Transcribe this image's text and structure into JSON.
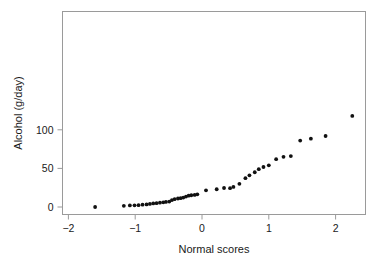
{
  "chart_data": {
    "type": "scatter",
    "title": "",
    "xlabel": "Normal scores",
    "ylabel": "Alcohol (g/day)",
    "xlim": [
      -2.32,
      2.43
    ],
    "ylim": [
      -8,
      128
    ],
    "xticks": [
      -2,
      -1,
      0,
      1,
      2
    ],
    "xtick_labels": [
      "−2",
      "−1",
      "0",
      "1",
      "2"
    ],
    "yticks": [
      0,
      50,
      100
    ],
    "ytick_labels": [
      "0",
      "50",
      "100"
    ],
    "grid": false,
    "legend": "none",
    "marker": "filled-circle",
    "marker_color": "#111111",
    "frame_color": "#9a9a9a",
    "points": [
      {
        "x": -1.6,
        "y": 0.0
      },
      {
        "x": -1.17,
        "y": 1.5
      },
      {
        "x": -1.08,
        "y": 2.0
      },
      {
        "x": -1.01,
        "y": 2.2
      },
      {
        "x": -0.95,
        "y": 2.3
      },
      {
        "x": -0.89,
        "y": 3.0
      },
      {
        "x": -0.83,
        "y": 3.4
      },
      {
        "x": -0.78,
        "y": 4.0
      },
      {
        "x": -0.73,
        "y": 4.6
      },
      {
        "x": -0.68,
        "y": 5.0
      },
      {
        "x": -0.63,
        "y": 5.6
      },
      {
        "x": -0.58,
        "y": 6.1
      },
      {
        "x": -0.54,
        "y": 6.6
      },
      {
        "x": -0.49,
        "y": 7.0
      },
      {
        "x": -0.45,
        "y": 9.0
      },
      {
        "x": -0.41,
        "y": 10.2
      },
      {
        "x": -0.36,
        "y": 11.0
      },
      {
        "x": -0.32,
        "y": 11.4
      },
      {
        "x": -0.28,
        "y": 12.2
      },
      {
        "x": -0.24,
        "y": 13.5
      },
      {
        "x": -0.2,
        "y": 14.7
      },
      {
        "x": -0.16,
        "y": 15.2
      },
      {
        "x": -0.11,
        "y": 15.6
      },
      {
        "x": -0.07,
        "y": 16.4
      },
      {
        "x": 0.06,
        "y": 21.6
      },
      {
        "x": 0.22,
        "y": 23.0
      },
      {
        "x": 0.33,
        "y": 24.6
      },
      {
        "x": 0.42,
        "y": 24.4
      },
      {
        "x": 0.47,
        "y": 26.0
      },
      {
        "x": 0.56,
        "y": 30.0
      },
      {
        "x": 0.65,
        "y": 37.4
      },
      {
        "x": 0.71,
        "y": 41.0
      },
      {
        "x": 0.79,
        "y": 45.0
      },
      {
        "x": 0.85,
        "y": 49.0
      },
      {
        "x": 0.92,
        "y": 51.8
      },
      {
        "x": 1.0,
        "y": 54.0
      },
      {
        "x": 1.11,
        "y": 62.0
      },
      {
        "x": 1.22,
        "y": 65.0
      },
      {
        "x": 1.33,
        "y": 66.0
      },
      {
        "x": 1.47,
        "y": 86.0
      },
      {
        "x": 1.63,
        "y": 88.5
      },
      {
        "x": 1.85,
        "y": 92.0
      },
      {
        "x": 2.25,
        "y": 118.0
      }
    ]
  }
}
